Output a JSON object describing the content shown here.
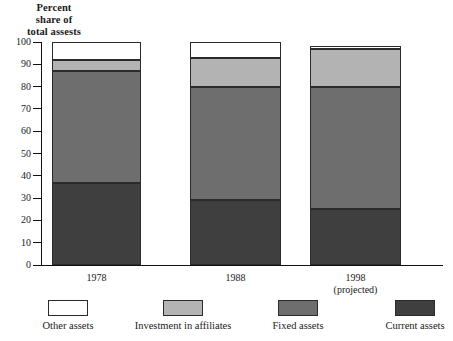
{
  "chart_data": {
    "type": "bar",
    "subtype": "stacked-vertical-100",
    "title": "Percent share of total assests",
    "title_lines": [
      "Percent",
      "share of",
      "total assests"
    ],
    "xlabel": "",
    "ylabel": "",
    "ylim": [
      0,
      100
    ],
    "ytick_labels": [
      "100",
      "90",
      "80",
      "70",
      "60",
      "50",
      "40",
      "30",
      "20",
      "10",
      "0"
    ],
    "ytick_values": [
      100,
      90,
      80,
      70,
      60,
      50,
      40,
      30,
      20,
      10,
      0
    ],
    "grid": false,
    "legend_position": "bottom",
    "categories": [
      "1978",
      "1988",
      "1998"
    ],
    "category_labels": [
      {
        "line1": "1978",
        "line2": ""
      },
      {
        "line1": "1988",
        "line2": ""
      },
      {
        "line1": "1998",
        "line2": "(projected)"
      }
    ],
    "series": [
      {
        "name": "Current assets",
        "color": "#3f3f3f",
        "values": [
          37,
          29,
          25
        ]
      },
      {
        "name": "Fixed assets",
        "color": "#6e6e6e",
        "values": [
          50,
          51,
          55
        ]
      },
      {
        "name": "Investment in affiliates",
        "color": "#b3b3b3",
        "values": [
          5,
          13,
          17
        ]
      },
      {
        "name": "Other assets",
        "color": "#ffffff",
        "values": [
          8,
          7,
          1
        ]
      }
    ],
    "stack_order_bottom_to_top": [
      "Current assets",
      "Fixed assets",
      "Investment in affiliates",
      "Other assets"
    ],
    "column_totals": [
      100,
      100,
      98
    ],
    "cumulative_tops": [
      {
        "category": "1978",
        "current": 37,
        "fixed": 87,
        "investment": 92,
        "other": 100
      },
      {
        "category": "1988",
        "current": 29,
        "fixed": 80,
        "investment": 93,
        "other": 100
      },
      {
        "category": "1998",
        "current": 25,
        "fixed": 80,
        "investment": 97,
        "other": 98
      }
    ]
  },
  "legend": {
    "items": [
      {
        "label": "Other assets",
        "color": "#ffffff"
      },
      {
        "label": "Investment in affiliates",
        "color": "#b3b3b3"
      },
      {
        "label": "Fixed assets",
        "color": "#6e6e6e"
      },
      {
        "label": "Current assets",
        "color": "#3f3f3f"
      }
    ]
  },
  "colors": {
    "other_assets": "#ffffff",
    "investment_in_affiliates": "#b3b3b3",
    "fixed_assets": "#6e6e6e",
    "current_assets": "#3f3f3f",
    "axis": "#111111",
    "outline": "#2b2b2b",
    "background": "#ffffff",
    "text": "#1a1a1a"
  }
}
